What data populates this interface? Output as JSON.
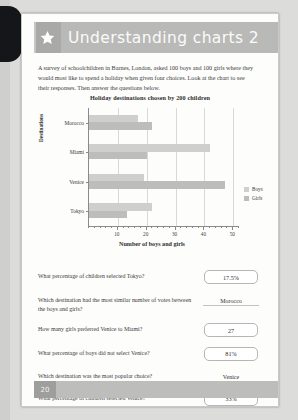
{
  "header": {
    "title": "Understanding charts 2",
    "star_icon": "star-icon"
  },
  "intro": "A survey of schoolchildren in Barnes, London, asked 100 boys and 100 girls where they would most like to spend a holiday when given four choices. Look at the chart to see their responses. Then answer the questions below.",
  "chart_data": {
    "type": "bar",
    "orientation": "horizontal",
    "title": "Holiday destinations chosen by 200 children",
    "xlabel": "Number of boys and girls",
    "ylabel": "Destinations",
    "categories": [
      "Morocco",
      "Miami",
      "Venice",
      "Tokyo"
    ],
    "series": [
      {
        "name": "Boys",
        "color": "#cfcfcd",
        "values": [
          17,
          42,
          19,
          22
        ]
      },
      {
        "name": "Girls",
        "color": "#bdbdbb",
        "values": [
          22,
          20,
          47,
          13
        ]
      }
    ],
    "xlim": [
      0,
      52
    ],
    "xticks": [
      10,
      20,
      30,
      40,
      50
    ],
    "xtick_labels": [
      "10",
      "20",
      "30",
      "40",
      "50"
    ],
    "minor_tick_step": 2,
    "grid": true,
    "legend_position": "right"
  },
  "questions": [
    {
      "text": "What percentage of children selected Tokyo?",
      "answer": "17.5%",
      "style": "box"
    },
    {
      "text": "Which destination had the most similar number of votes between the boys and girls?",
      "answer": "Morocco",
      "style": "line"
    },
    {
      "text": "How many girls preferred Venice to Miami?",
      "answer": "27",
      "style": "box"
    },
    {
      "text": "What percentage of boys did not select Venice?",
      "answer": "81%",
      "style": "box"
    },
    {
      "text": "Which destination was the most popular choice?",
      "answer": "Venice",
      "style": "line"
    },
    {
      "text": "What percentage of children selected Venice?",
      "answer": "33%",
      "style": "box"
    }
  ],
  "footer": {
    "page_number": "20"
  }
}
